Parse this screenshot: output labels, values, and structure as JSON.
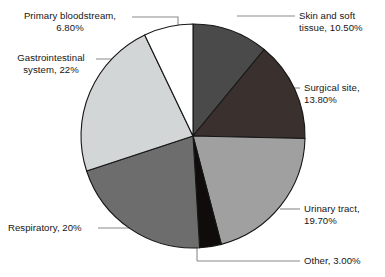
{
  "chart_data": {
    "type": "pie",
    "title": "",
    "subtitle": "",
    "xlabel": "",
    "ylabel": "",
    "legend_position": "none",
    "grid": false,
    "start_angle_deg": 0,
    "direction": "clockwise",
    "categories": [
      "Skin and soft tissue",
      "Surgical site",
      "Urinary tract",
      "Other",
      "Respiratory",
      "Gastrointestinal system",
      "Primary bloodstream"
    ],
    "values": [
      10.5,
      13.8,
      19.7,
      3.0,
      20,
      22,
      6.8
    ],
    "value_labels": [
      "10.50%",
      "13.80%",
      "19.70%",
      "3.00%",
      "20%",
      "22%",
      "6.80%"
    ],
    "colors": [
      "#4a4a4a",
      "#3a302e",
      "#a0a0a0",
      "#100c0c",
      "#6d6d6d",
      "#d2d6d6",
      "#ffffff"
    ],
    "slices": [
      {
        "name": "skin-and-soft-tissue",
        "label_line1": "Skin and soft",
        "label_line2": "tissue, 10.50%",
        "label_full": "Skin and soft tissue, 10.50%",
        "value": 10.5,
        "value_label": "10.50%",
        "color": "#4a4a4a"
      },
      {
        "name": "surgical-site",
        "label_line1": "Surgical site,",
        "label_line2": "13.80%",
        "label_full": "Surgical site, 13.80%",
        "value": 13.8,
        "value_label": "13.80%",
        "color": "#3a302e"
      },
      {
        "name": "urinary-tract",
        "label_line1": "Urinary tract,",
        "label_line2": "19.70%",
        "label_full": "Urinary tract, 19.70%",
        "value": 19.7,
        "value_label": "19.70%",
        "color": "#a0a0a0"
      },
      {
        "name": "other",
        "label_line1": "Other, 3.00%",
        "label_line2": "",
        "label_full": "Other, 3.00%",
        "value": 3.0,
        "value_label": "3.00%",
        "color": "#100c0c"
      },
      {
        "name": "respiratory",
        "label_line1": "Respiratory, 20%",
        "label_line2": "",
        "label_full": "Respiratory, 20%",
        "value": 20,
        "value_label": "20%",
        "color": "#6d6d6d"
      },
      {
        "name": "gastrointestinal-system",
        "label_line1": "Gastrointestinal",
        "label_line2": "system, 22%",
        "label_full": "Gastrointestinal system, 22%",
        "value": 22,
        "value_label": "22%",
        "color": "#d2d6d6"
      },
      {
        "name": "primary-bloodstream",
        "label_line1": "Primary bloodstream,",
        "label_line2": "6.80%",
        "label_full": "Primary bloodstream, 6.80%",
        "value": 6.8,
        "value_label": "6.80%",
        "color": "#ffffff"
      }
    ]
  },
  "labels": {
    "skin_and_soft_tissue": "Skin and soft\ntissue, 10.50%",
    "surgical_site": "Surgical site,\n13.80%",
    "urinary_tract": "Urinary tract,\n19.70%",
    "other": "Other, 3.00%",
    "respiratory": "Respiratory, 20%",
    "gastrointestinal_system": "Gastrointestinal\nsystem, 22%",
    "primary_bloodstream": "Primary bloodstream,\n6.80%"
  },
  "style": {
    "outline_color": "#1a1a1a",
    "leader_color": "#808080",
    "background": "#ffffff"
  }
}
